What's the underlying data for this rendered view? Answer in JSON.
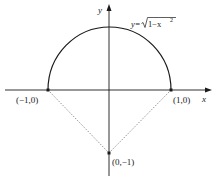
{
  "diagram": {
    "type": "semicircle-on-axes",
    "axes": {
      "x_label": "x",
      "y_label": "y"
    },
    "curve": {
      "equation_lhs": "y=",
      "equation_radicand_base": "1−x",
      "equation_exponent": "2",
      "equation_text": "y=√(1−x²)"
    },
    "points": [
      {
        "label": "(−1,0)",
        "x": -1,
        "y": 0
      },
      {
        "label": "(1,0)",
        "x": 1,
        "y": 0
      },
      {
        "label": "(0,−1)",
        "x": 0,
        "y": -1
      }
    ],
    "segments": [
      {
        "from": "(−1,0)",
        "to": "(0,−1)",
        "style": "dotted"
      },
      {
        "from": "(0,−1)",
        "to": "(1,0)",
        "style": "dotted"
      }
    ],
    "colors": {
      "ink": "#1a1a1a",
      "dotted": "#888888"
    }
  }
}
